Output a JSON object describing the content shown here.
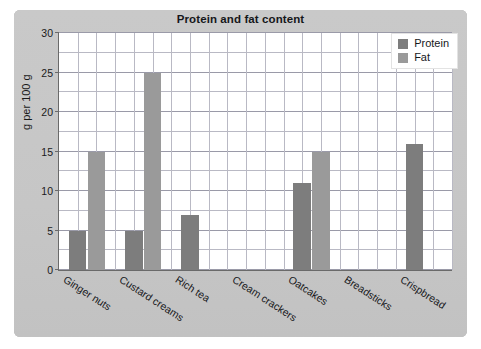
{
  "chart_data": {
    "type": "bar",
    "title": "Protein and fat content",
    "xlabel": "",
    "ylabel": "g per 100 g",
    "ylim": [
      0,
      30
    ],
    "ytick_step": 5,
    "yticks": [
      0,
      5,
      10,
      15,
      20,
      25,
      30
    ],
    "grid": true,
    "legend_position": "top-right",
    "categories": [
      "Ginger nuts",
      "Custard creams",
      "Rich tea",
      "Cream crackers",
      "Oatcakes",
      "Breadsticks",
      "Crispbread"
    ],
    "series": [
      {
        "name": "Protein",
        "color": "#7d7d7d",
        "values": [
          5,
          5,
          7,
          null,
          11,
          null,
          16
        ]
      },
      {
        "name": "Fat",
        "color": "#9a9a9a",
        "values": [
          15,
          25,
          null,
          null,
          15,
          null,
          null
        ]
      }
    ]
  },
  "legend": {
    "items": [
      {
        "label": "Protein",
        "swatch": "protein"
      },
      {
        "label": "Fat",
        "swatch": "fat"
      }
    ]
  },
  "colors": {
    "panel": "#c9c9c9",
    "plot_background": "#ffffff",
    "grid": "#b9b9c4",
    "axis": "#6a6a6a",
    "protein": "#7d7d7d",
    "fat": "#9a9a9a",
    "text": "#16171a"
  }
}
